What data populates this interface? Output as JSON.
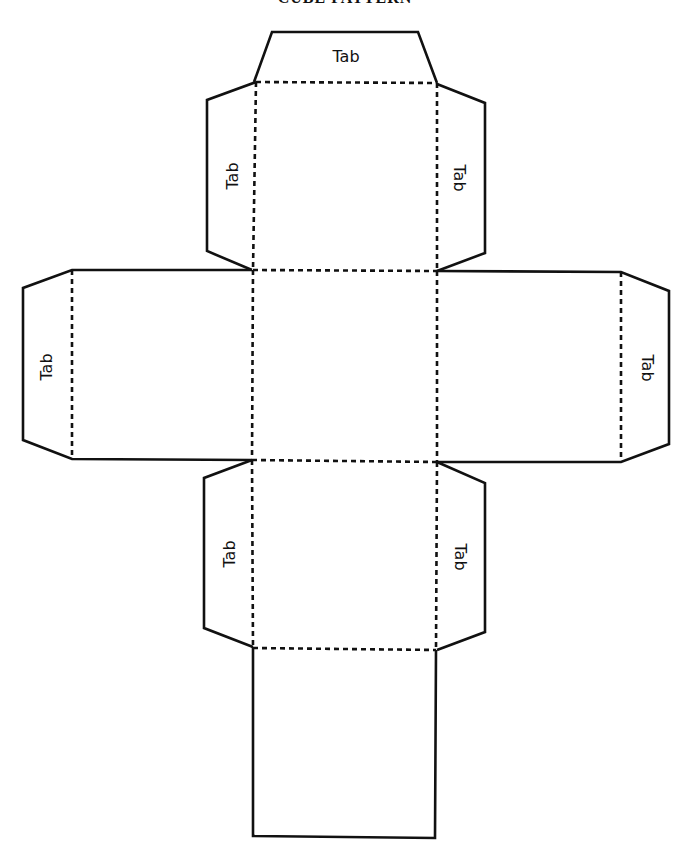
{
  "title": "CUBE PATTERN",
  "labels": {
    "top_tab": "Tab",
    "upper_left_tab": "Tab",
    "upper_right_tab": "Tab",
    "left_face_tab": "Tab",
    "right_face_tab": "Tab",
    "lower_left_tab": "Tab",
    "lower_right_tab": "Tab"
  },
  "legend": {
    "solid_line": "cut",
    "dashed_line": "fold"
  },
  "colors": {
    "line": "#111111",
    "background": "#ffffff"
  }
}
